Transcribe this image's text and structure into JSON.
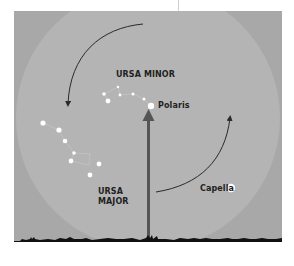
{
  "diagram": {
    "title": "",
    "colors": {
      "page_background": "#ffffff",
      "sky_panel": "#a9a9a9",
      "sky_circle": "#b3b3b3",
      "ground": "#111111",
      "stars": "#ffffff",
      "arrows": "#2a2a2a",
      "pole_arrow": "#555555",
      "text": "#1f1f1f"
    },
    "labels": {
      "ursa_minor": "URSA MINOR",
      "polaris": "Polaris",
      "ursa_major_line1": "URSA",
      "ursa_major_line2": "MAJOR",
      "capella": "Capella"
    },
    "constellations": {
      "ursa_minor": {
        "name": "URSA MINOR",
        "star_count": 7
      },
      "ursa_major": {
        "name": "URSA MAJOR",
        "star_count": 7
      }
    },
    "stars": {
      "polaris": {
        "name": "Polaris"
      },
      "capella": {
        "name": "Capella"
      }
    },
    "annotations": [
      "Curved arrow counter-clockwise from top toward Ursa Major (left side)",
      "Curved arrow counter-clockwise from bottom-right rising on right side",
      "Vertical arrow from horizon pointing up to Polaris"
    ]
  }
}
